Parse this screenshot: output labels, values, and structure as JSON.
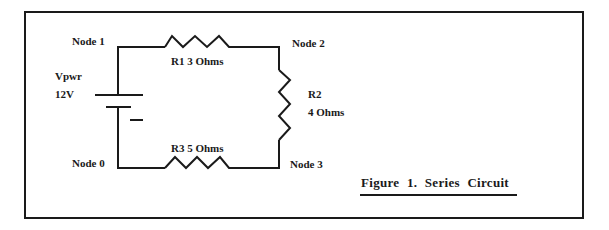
{
  "figure": {
    "caption": "Figure  1. Series  Circuit",
    "type": "series-circuit"
  },
  "nodes": [
    {
      "id": "node-1",
      "label": "Node  1"
    },
    {
      "id": "node-2",
      "label": "Node  2"
    },
    {
      "id": "node-3",
      "label": "Node  3"
    },
    {
      "id": "node-0",
      "label": "Node  0"
    }
  ],
  "source": {
    "name": "Vpwr",
    "value": "12V",
    "polarity_mark": "−"
  },
  "resistors": [
    {
      "name": "R1",
      "value": "3  Ohms",
      "label": "R1    3  Ohms"
    },
    {
      "name": "R2",
      "value": "4  Ohms"
    },
    {
      "name": "R3",
      "value": "5  Ohms",
      "label": "R3    5  Ohms"
    }
  ],
  "colors": {
    "ink": "#1a1a1a",
    "background": "#ffffff"
  }
}
